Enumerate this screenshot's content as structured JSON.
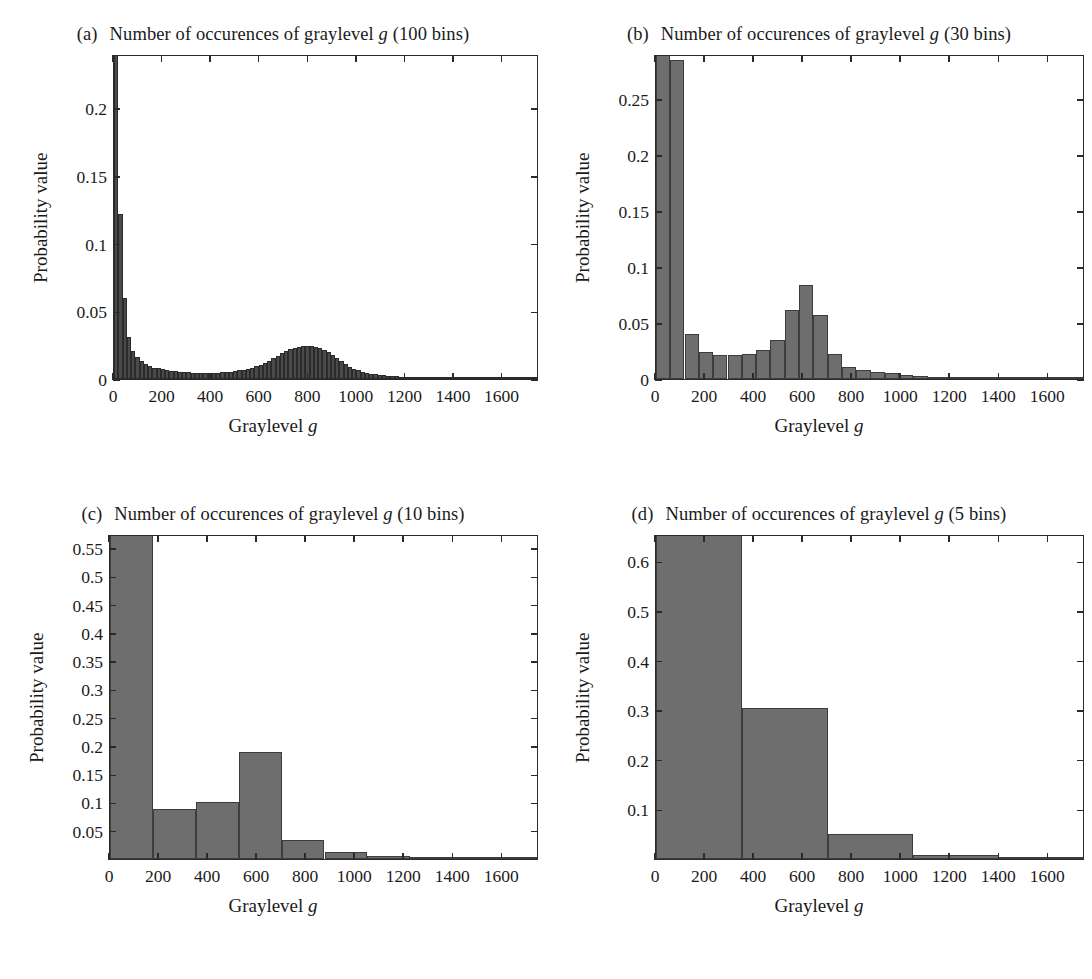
{
  "figure": {
    "axis_label_x": "Graylevel",
    "axis_label_x_italic": "g",
    "axis_label_y": "Probability value",
    "bar_fill": "#6e6e6e",
    "bar_edge": "#3d3d3d",
    "frame_color": "#2a2a2a",
    "ghost_caption": ""
  },
  "panels": [
    {
      "tag": "(a)",
      "title_pre": "Number of occurences of graylevel",
      "title_italic": "g",
      "title_post": "(100 bins)"
    },
    {
      "tag": "(b)",
      "title_pre": "Number of occurences of graylevel",
      "title_italic": "g",
      "title_post": "(30 bins)"
    },
    {
      "tag": "(c)",
      "title_pre": "Number of occurences of graylevel",
      "title_italic": "g",
      "title_post": "(10 bins)"
    },
    {
      "tag": "(d)",
      "title_pre": "Number of occurences of graylevel",
      "title_italic": "g",
      "title_post": "(5 bins)"
    }
  ],
  "chart_data": [
    {
      "id": "a",
      "type": "bar",
      "title": "(a) Number of occurences of graylevel g (100 bins)",
      "xlabel": "Graylevel g",
      "ylabel": "Probability value",
      "xlim": [
        0,
        1750
      ],
      "ylim": [
        0,
        0.24
      ],
      "xticks": [
        0,
        200,
        400,
        600,
        800,
        1000,
        1200,
        1400,
        1600
      ],
      "xticklabels": [
        "0",
        "200",
        "400",
        "600",
        "800",
        "1000",
        "1200",
        "1400",
        "1600"
      ],
      "yticks": [
        0,
        0.05,
        0.1,
        0.15,
        0.2
      ],
      "yticklabels": [
        "0",
        "0.05",
        "0.1",
        "0.15",
        "0.2"
      ],
      "grid": false,
      "legend": "none",
      "bin_width": 17.5,
      "note": "first bar is clipped by the top of the axes",
      "x": [
        8.75,
        26.25,
        43.75,
        61.25,
        78.75,
        96.25,
        113.75,
        131.25,
        148.75,
        166.25,
        183.75,
        201.25,
        218.75,
        236.25,
        253.75,
        271.25,
        288.75,
        306.25,
        323.75,
        341.25,
        358.75,
        376.25,
        393.75,
        411.25,
        428.75,
        446.25,
        463.75,
        481.25,
        498.75,
        516.25,
        533.75,
        551.25,
        568.75,
        586.25,
        603.75,
        621.25,
        638.75,
        656.25,
        673.75,
        691.25,
        708.75,
        726.25,
        743.75,
        761.25,
        778.75,
        796.25,
        813.75,
        831.25,
        848.75,
        866.25,
        883.75,
        901.25,
        918.75,
        936.25,
        953.75,
        971.25,
        988.75,
        1006.25,
        1023.75,
        1041.25,
        1058.75,
        1076.25,
        1093.75,
        1111.25,
        1128.75,
        1146.25,
        1163.75,
        1181.25,
        1198.75,
        1216.25,
        1233.75,
        1251.25,
        1268.75,
        1286.25,
        1303.75,
        1321.25,
        1338.75,
        1356.25,
        1373.75,
        1391.25,
        1408.75,
        1426.25,
        1443.75,
        1461.25,
        1478.75,
        1496.25,
        1513.75,
        1531.25,
        1548.75,
        1566.25,
        1583.75,
        1601.25,
        1618.75,
        1636.25,
        1653.75,
        1671.25,
        1688.75,
        1706.25,
        1723.75,
        1741.25
      ],
      "values": [
        0.285,
        0.122,
        0.06,
        0.031,
        0.021,
        0.016,
        0.013,
        0.011,
        0.0095,
        0.0085,
        0.0078,
        0.0072,
        0.0066,
        0.0062,
        0.0058,
        0.0055,
        0.0052,
        0.005,
        0.0048,
        0.0047,
        0.0046,
        0.0045,
        0.0045,
        0.0046,
        0.0047,
        0.0049,
        0.0051,
        0.0054,
        0.0058,
        0.0063,
        0.0069,
        0.0076,
        0.0084,
        0.0094,
        0.0106,
        0.012,
        0.0136,
        0.0154,
        0.0172,
        0.019,
        0.0206,
        0.022,
        0.0231,
        0.0239,
        0.0244,
        0.0246,
        0.0244,
        0.0238,
        0.0228,
        0.0214,
        0.0196,
        0.0175,
        0.0152,
        0.013,
        0.011,
        0.0092,
        0.0077,
        0.0064,
        0.0054,
        0.0046,
        0.0039,
        0.0034,
        0.003,
        0.0026,
        0.0023,
        0.0021,
        0.0019,
        0.0017,
        0.0016,
        0.0015,
        0.0014,
        0.0013,
        0.0012,
        0.0011,
        0.0011,
        0.001,
        0.001,
        0.0009,
        0.0009,
        0.0008,
        0.0008,
        0.0007,
        0.0007,
        0.0006,
        0.0006,
        0.0005,
        0.0005,
        0.0005,
        0.0004,
        0.0004,
        0.0004,
        0.0003,
        0.0003,
        0.0003,
        0.0002,
        0.0002,
        0.0002,
        0.0002,
        0.0001,
        0.0001
      ]
    },
    {
      "id": "b",
      "type": "bar",
      "title": "(b) Number of occurences of graylevel g (30 bins)",
      "xlabel": "Graylevel g",
      "ylabel": "Probability value",
      "xlim": [
        0,
        1750
      ],
      "ylim": [
        0,
        0.29
      ],
      "xticks": [
        0,
        200,
        400,
        600,
        800,
        1000,
        1200,
        1400,
        1600
      ],
      "xticklabels": [
        "0",
        "200",
        "400",
        "600",
        "800",
        "1000",
        "1200",
        "1400",
        "1600"
      ],
      "yticks": [
        0,
        0.05,
        0.1,
        0.15,
        0.2,
        0.25
      ],
      "yticklabels": [
        "0",
        "0.05",
        "0.1",
        "0.15",
        "0.2",
        "0.25"
      ],
      "grid": false,
      "legend": "none",
      "bin_width": 58.33,
      "note": "first bar is clipped by the top of the axes",
      "x": [
        29,
        87,
        146,
        204,
        262,
        321,
        379,
        437,
        496,
        554,
        612,
        671,
        729,
        787,
        846,
        904,
        962,
        1021,
        1079,
        1137,
        1196,
        1254,
        1312,
        1371,
        1429,
        1487,
        1546,
        1604,
        1662,
        1721
      ],
      "values": [
        0.3,
        0.285,
        0.04,
        0.024,
        0.021,
        0.021,
        0.022,
        0.026,
        0.035,
        0.062,
        0.084,
        0.057,
        0.022,
        0.011,
        0.008,
        0.0062,
        0.005,
        0.0036,
        0.0026,
        0.002,
        0.0014,
        0.001,
        0.0008,
        0.0006,
        0.0005,
        0.0004,
        0.0003,
        0.0002,
        0.0002,
        0.0001
      ]
    },
    {
      "id": "c",
      "type": "bar",
      "title": "(c) Number of occurences of graylevel g (10 bins)",
      "xlabel": "Graylevel g",
      "ylabel": "Probability value",
      "xlim": [
        0,
        1750
      ],
      "ylim": [
        0,
        0.575
      ],
      "xticks": [
        0,
        200,
        400,
        600,
        800,
        1000,
        1200,
        1400,
        1600
      ],
      "xticklabels": [
        "0",
        "200",
        "400",
        "600",
        "800",
        "1000",
        "1200",
        "1400",
        "1600"
      ],
      "yticks": [
        0.05,
        0.1,
        0.15,
        0.2,
        0.25,
        0.3,
        0.35,
        0.4,
        0.45,
        0.5,
        0.55
      ],
      "yticklabels": [
        "0.05",
        "0.1",
        "0.15",
        "0.2",
        "0.25",
        "0.3",
        "0.35",
        "0.4",
        "0.45",
        "0.5",
        "0.55"
      ],
      "grid": false,
      "legend": "none",
      "bin_width": 175,
      "note": "first bar is clipped by the top of the axes",
      "x": [
        87.5,
        262.5,
        437.5,
        612.5,
        787.5,
        962.5,
        1137.5,
        1312.5,
        1487.5,
        1662.5
      ],
      "values": [
        0.59,
        0.089,
        0.101,
        0.19,
        0.034,
        0.012,
        0.0045,
        0.0022,
        0.001,
        0.0005
      ]
    },
    {
      "id": "d",
      "type": "bar",
      "title": "(d) Number of occurences of graylevel g (5 bins)",
      "xlabel": "Graylevel g",
      "ylabel": "Probability value",
      "xlim": [
        0,
        1750
      ],
      "ylim": [
        0,
        0.655
      ],
      "xticks": [
        0,
        200,
        400,
        600,
        800,
        1000,
        1200,
        1400,
        1600
      ],
      "xticklabels": [
        "0",
        "200",
        "400",
        "600",
        "800",
        "1000",
        "1200",
        "1400",
        "1600"
      ],
      "yticks": [
        0.1,
        0.2,
        0.3,
        0.4,
        0.5,
        0.6
      ],
      "yticklabels": [
        "0.1",
        "0.2",
        "0.3",
        "0.4",
        "0.5",
        "0.6"
      ],
      "grid": false,
      "legend": "none",
      "bin_width": 350,
      "note": "first bar is clipped by the top of the axes",
      "x": [
        175,
        525,
        875,
        1225,
        1575
      ],
      "values": [
        0.672,
        0.305,
        0.05,
        0.008,
        0.005
      ]
    }
  ]
}
